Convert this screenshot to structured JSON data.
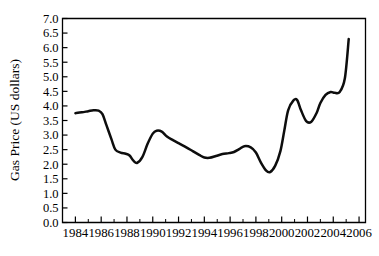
{
  "chart_data": {
    "type": "line",
    "title": "",
    "subtitle": "",
    "xlabel": "",
    "ylabel": "Gas Price (US dollars)",
    "xlim": [
      1983,
      2006.5
    ],
    "ylim": [
      0.0,
      7.0
    ],
    "grid": false,
    "legend": null,
    "legend_position": "none",
    "x_ticks": [
      1984,
      1986,
      1988,
      1990,
      1992,
      1994,
      1996,
      1998,
      2000,
      2002,
      2004,
      2006
    ],
    "x_tick_labels": [
      "1984",
      "1986",
      "1988",
      "1990",
      "1992",
      "1994",
      "1996",
      "1998",
      "2000",
      "2002",
      "2004",
      "2006"
    ],
    "x_minor_ticks": [
      1985,
      1987,
      1989,
      1991,
      1993,
      1995,
      1997,
      1999,
      2001,
      2003,
      2005
    ],
    "y_ticks": [
      0.0,
      0.5,
      1.0,
      1.5,
      2.0,
      2.5,
      3.0,
      3.5,
      4.0,
      4.5,
      5.0,
      5.5,
      6.0,
      6.5,
      7.0
    ],
    "y_tick_labels": [
      "0.0",
      "0.5",
      "1.0",
      "1.5",
      "2.0",
      "2.5",
      "3.0",
      "3.5",
      "4.0",
      "4.5",
      "5.0",
      "5.5",
      "6.0",
      "6.5",
      "7.0"
    ],
    "line_color": "#0d0d0d",
    "series": [
      {
        "name": "Gas Price",
        "x": [
          1984.0,
          1984.5,
          1985.0,
          1985.4,
          1985.8,
          1986.1,
          1986.4,
          1986.8,
          1987.1,
          1987.5,
          1987.9,
          1988.2,
          1988.5,
          1988.8,
          1989.2,
          1989.6,
          1990.0,
          1990.3,
          1990.7,
          1991.1,
          1991.6,
          1992.1,
          1992.6,
          1993.1,
          1993.6,
          1994.0,
          1994.4,
          1994.9,
          1995.4,
          1995.9,
          1996.3,
          1996.7,
          1997.1,
          1997.6,
          1998.0,
          1998.4,
          1998.8,
          1999.1,
          1999.5,
          1999.9,
          2000.2,
          2000.5,
          2000.9,
          2001.2,
          2001.5,
          2001.9,
          2002.3,
          2002.7,
          2003.0,
          2003.4,
          2003.8,
          2004.1,
          2004.5,
          2004.9,
          2005.2
        ],
        "y": [
          3.75,
          3.78,
          3.82,
          3.85,
          3.84,
          3.72,
          3.35,
          2.85,
          2.5,
          2.4,
          2.36,
          2.3,
          2.12,
          2.05,
          2.25,
          2.7,
          3.05,
          3.15,
          3.12,
          2.95,
          2.82,
          2.7,
          2.58,
          2.45,
          2.32,
          2.23,
          2.22,
          2.28,
          2.35,
          2.38,
          2.42,
          2.52,
          2.62,
          2.58,
          2.4,
          2.05,
          1.78,
          1.73,
          1.95,
          2.45,
          3.15,
          3.85,
          4.18,
          4.2,
          3.85,
          3.48,
          3.46,
          3.75,
          4.1,
          4.38,
          4.48,
          4.45,
          4.48,
          4.95,
          6.3
        ]
      }
    ]
  }
}
